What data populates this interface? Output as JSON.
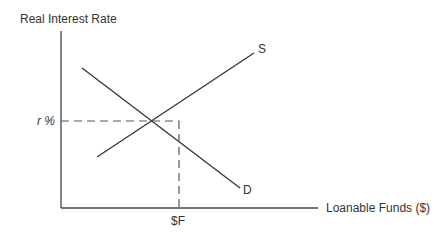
{
  "diagram": {
    "type": "supply-demand",
    "y_axis_label": "Real Interest Rate",
    "x_axis_label": "Loanable Funds ($)",
    "supply_label": "S",
    "demand_label": "D",
    "equilibrium_rate_label": "r %",
    "equilibrium_quantity_label": "$F"
  }
}
